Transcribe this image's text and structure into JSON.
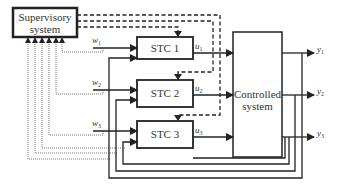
{
  "diagram": {
    "title": "",
    "blocks": {
      "supervisory": {
        "line1": "Supervisory",
        "line2": "system"
      },
      "stc1": {
        "label": "STC 1"
      },
      "stc2": {
        "label": "STC 2"
      },
      "stc3": {
        "label": "STC 3"
      },
      "controlled": {
        "line1": "Controlled",
        "line2": "system"
      }
    },
    "signals": {
      "w1": {
        "base": "w",
        "sub": "1"
      },
      "w2": {
        "base": "w",
        "sub": "2"
      },
      "w3": {
        "base": "w",
        "sub": "3"
      },
      "u1": {
        "base": "u",
        "sub": "1"
      },
      "u2": {
        "base": "u",
        "sub": "2"
      },
      "u3": {
        "base": "u",
        "sub": "3"
      },
      "y1": {
        "base": "y",
        "sub": "1"
      },
      "y2": {
        "base": "y",
        "sub": "2"
      },
      "y3": {
        "base": "y",
        "sub": "3"
      }
    },
    "line_styles": {
      "solid": "signal flow",
      "dashed": "supervisory commands to STCs",
      "dotted": "signals reported to supervisory system"
    },
    "colors": {
      "line": "#222222",
      "dotted": "#777777",
      "text": "#333333"
    }
  }
}
